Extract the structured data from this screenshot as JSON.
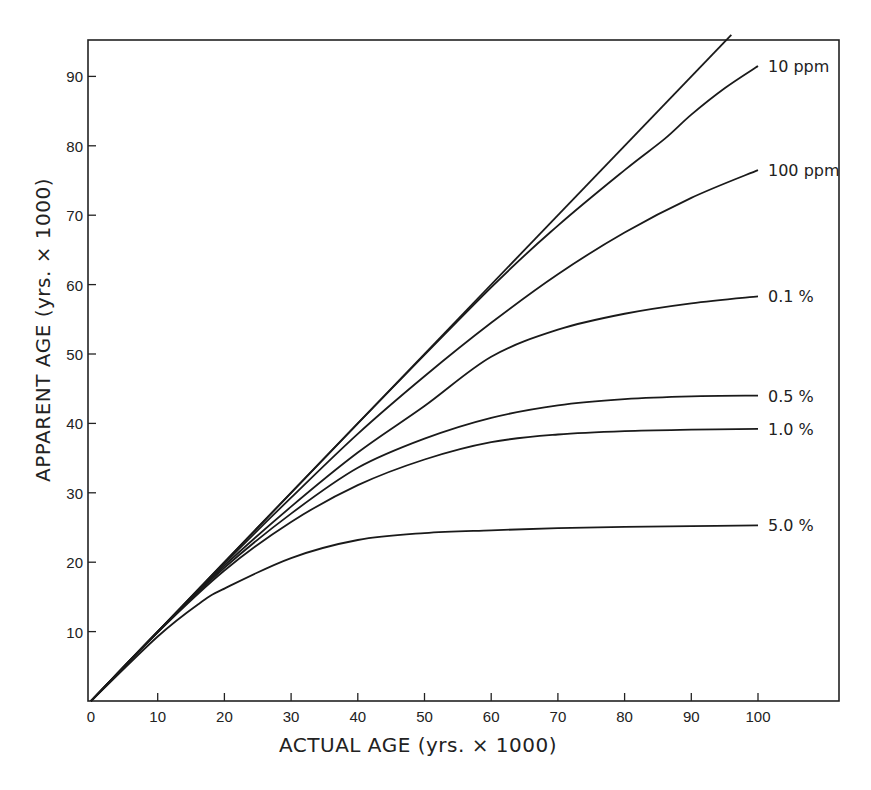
{
  "chart_data": {
    "type": "line",
    "title": "",
    "xlabel": "ACTUAL AGE (yrs. × 1000)",
    "ylabel": "APPARENT AGE (yrs. × 1000)",
    "xlim": [
      0,
      112
    ],
    "ylim": [
      0,
      96
    ],
    "xticks": [
      0,
      10,
      20,
      30,
      40,
      50,
      60,
      70,
      80,
      90,
      100
    ],
    "yticks": [
      10,
      20,
      30,
      40,
      50,
      60,
      70,
      80,
      90
    ],
    "grid": false,
    "legend": "inline labels at right end of curves",
    "series": [
      {
        "name": "",
        "label": "",
        "x": [
          0,
          96
        ],
        "y": [
          0,
          96
        ]
      },
      {
        "name": "10 ppm",
        "label": "10 ppm",
        "x": [
          0,
          20,
          40,
          60,
          70,
          80,
          86,
          90,
          95,
          100
        ],
        "y": [
          0,
          20,
          40,
          59.6,
          68.5,
          76.5,
          81,
          84.5,
          88.3,
          91.5
        ]
      },
      {
        "name": "100 ppm",
        "label": "100 ppm",
        "x": [
          0,
          20,
          30,
          40,
          50,
          60,
          70,
          80,
          90,
          100
        ],
        "y": [
          0,
          19.8,
          29.3,
          38.5,
          46.8,
          54.5,
          61.5,
          67.5,
          72.5,
          76.5
        ]
      },
      {
        "name": "0.1 %",
        "label": "0.1 %",
        "x": [
          0,
          10,
          20,
          30,
          40,
          50,
          60,
          70,
          80,
          90,
          100
        ],
        "y": [
          0,
          10,
          19.5,
          28,
          35.8,
          42.5,
          49.6,
          53.5,
          55.8,
          57.3,
          58.3
        ]
      },
      {
        "name": "0.5 %",
        "label": "0.5 %",
        "x": [
          0,
          10,
          20,
          30,
          40,
          50,
          60,
          70,
          80,
          90,
          100
        ],
        "y": [
          0,
          10,
          19.2,
          27,
          33.6,
          37.8,
          40.8,
          42.6,
          43.5,
          43.9,
          44
        ]
      },
      {
        "name": "1.0 %",
        "label": "1.0 %",
        "x": [
          0,
          10,
          20,
          30,
          40,
          50,
          60,
          70,
          80,
          90,
          100
        ],
        "y": [
          0,
          9.9,
          18.8,
          25.8,
          31.1,
          34.8,
          37.3,
          38.4,
          38.9,
          39.1,
          39.2
        ]
      },
      {
        "name": "5.0 %",
        "label": "5.0 %",
        "x": [
          0,
          10,
          16.3,
          20,
          30,
          40,
          50,
          60,
          70,
          80,
          90,
          100
        ],
        "y": [
          0,
          9.3,
          14.1,
          16.2,
          20.6,
          23.2,
          24.2,
          24.6,
          24.9,
          25.1,
          25.2,
          25.3
        ]
      }
    ]
  },
  "labels": {
    "xlabel": "ACTUAL AGE (yrs. × 1000)",
    "ylabel": "APPARENT AGE (yrs. × 1000)"
  }
}
